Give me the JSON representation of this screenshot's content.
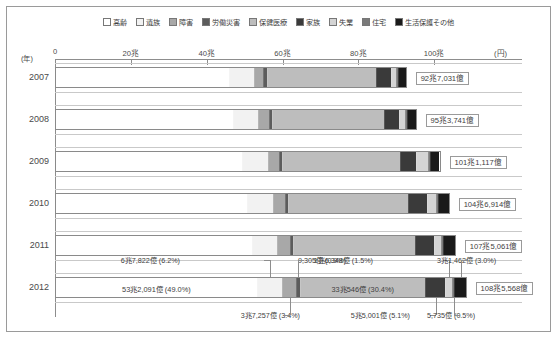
{
  "legend": {
    "items": [
      {
        "label": "高齢",
        "color": "#ffffff"
      },
      {
        "label": "遺族",
        "color": "#f2f2f2"
      },
      {
        "label": "障害",
        "color": "#a8a8a8"
      },
      {
        "label": "労働災害",
        "color": "#5c5c5c"
      },
      {
        "label": "保健医療",
        "color": "#bdbdbd"
      },
      {
        "label": "家族",
        "color": "#3a3a3a"
      },
      {
        "label": "失業",
        "color": "#d4d4d4"
      },
      {
        "label": "住宅",
        "color": "#7a7a7a"
      },
      {
        "label": "生活保護その他",
        "color": "#1a1a1a"
      }
    ]
  },
  "axis": {
    "year_unit": "(年)",
    "value_unit": "(円)",
    "ticks": [
      "0",
      "20兆",
      "40兆",
      "60兆",
      "80兆",
      "100兆"
    ],
    "tick_values": [
      0,
      20,
      40,
      60,
      80,
      100
    ],
    "max": 120
  },
  "chart_data": {
    "type": "bar",
    "orientation": "horizontal",
    "stacked": true,
    "title": "",
    "xlabel": "(円)",
    "ylabel": "(年)",
    "xlim": [
      0,
      120
    ],
    "grid": false,
    "legend_position": "top",
    "unit_note": "兆 = trillion, 億 = hundred million",
    "categories": [
      "2007",
      "2008",
      "2009",
      "2010",
      "2011",
      "2012"
    ],
    "series": [
      {
        "name": "高齢",
        "values": [
          45.8,
          47.0,
          49.4,
          50.7,
          51.9,
          53.2091
        ]
      },
      {
        "name": "遺族",
        "values": [
          6.6,
          6.6,
          6.7,
          6.7,
          6.7,
          6.7822
        ]
      },
      {
        "name": "障害",
        "values": [
          2.6,
          2.8,
          3.0,
          3.2,
          3.4,
          3.7257
        ]
      },
      {
        "name": "労働災害",
        "values": [
          0.95,
          0.95,
          0.94,
          0.93,
          0.93,
          0.9305
        ]
      },
      {
        "name": "保健医療",
        "values": [
          29.0,
          29.6,
          31.1,
          31.8,
          32.2,
          33.0546
        ]
      },
      {
        "name": "家族",
        "values": [
          4.0,
          4.1,
          4.4,
          5.0,
          5.2,
          5.5001
        ]
      },
      {
        "name": "失業",
        "values": [
          1.3,
          1.6,
          3.1,
          2.4,
          1.8,
          1.6348
        ]
      },
      {
        "name": "住宅",
        "values": [
          0.49,
          0.52,
          0.54,
          0.55,
          0.56,
          0.5735
        ]
      },
      {
        "name": "生活保護その他",
        "values": [
          2.0,
          2.2,
          2.5,
          2.8,
          3.0,
          3.1462
        ]
      }
    ],
    "totals": [
      92.7031,
      95.3741,
      101.1117,
      104.6914,
      107.5061,
      108.5568
    ],
    "total_labels": [
      "92兆7,031億",
      "95兆3,741億",
      "101兆1,117億",
      "104兆6,914億",
      "107兆5,061億",
      "108兆5,568億"
    ]
  },
  "bars": [
    {
      "year": "2007",
      "total_label": "92兆7,031億",
      "segments": [
        {
          "name": "高齢",
          "value": 45.8
        },
        {
          "name": "遺族",
          "value": 6.6
        },
        {
          "name": "障害",
          "value": 2.6
        },
        {
          "name": "労働災害",
          "value": 0.95
        },
        {
          "name": "保健医療",
          "value": 29.0
        },
        {
          "name": "家族",
          "value": 4.0
        },
        {
          "name": "失業",
          "value": 1.3
        },
        {
          "name": "住宅",
          "value": 0.49
        },
        {
          "name": "生活保護その他",
          "value": 2.0
        }
      ]
    },
    {
      "year": "2008",
      "total_label": "95兆3,741億",
      "segments": [
        {
          "name": "高齢",
          "value": 47.0
        },
        {
          "name": "遺族",
          "value": 6.6
        },
        {
          "name": "障害",
          "value": 2.8
        },
        {
          "name": "労働災害",
          "value": 0.95
        },
        {
          "name": "保健医療",
          "value": 29.6
        },
        {
          "name": "家族",
          "value": 4.1
        },
        {
          "name": "失業",
          "value": 1.6
        },
        {
          "name": "住宅",
          "value": 0.52
        },
        {
          "name": "生活保護その他",
          "value": 2.2
        }
      ]
    },
    {
      "year": "2009",
      "total_label": "101兆1,117億",
      "segments": [
        {
          "name": "高齢",
          "value": 49.4
        },
        {
          "name": "遺族",
          "value": 6.7
        },
        {
          "name": "障害",
          "value": 3.0
        },
        {
          "name": "労働災害",
          "value": 0.94
        },
        {
          "name": "保健医療",
          "value": 31.1
        },
        {
          "name": "家族",
          "value": 4.4
        },
        {
          "name": "失業",
          "value": 3.1
        },
        {
          "name": "住宅",
          "value": 0.54
        },
        {
          "name": "生活保護その他",
          "value": 2.5
        }
      ]
    },
    {
      "year": "2010",
      "total_label": "104兆6,914億",
      "segments": [
        {
          "name": "高齢",
          "value": 50.7
        },
        {
          "name": "遺族",
          "value": 6.7
        },
        {
          "name": "障害",
          "value": 3.2
        },
        {
          "name": "労働災害",
          "value": 0.93
        },
        {
          "name": "保健医療",
          "value": 31.8
        },
        {
          "name": "家族",
          "value": 5.0
        },
        {
          "name": "失業",
          "value": 2.4
        },
        {
          "name": "住宅",
          "value": 0.55
        },
        {
          "name": "生活保護その他",
          "value": 2.8
        }
      ]
    },
    {
      "year": "2011",
      "total_label": "107兆5,061億",
      "segments": [
        {
          "name": "高齢",
          "value": 51.9
        },
        {
          "name": "遺族",
          "value": 6.7
        },
        {
          "name": "障害",
          "value": 3.4
        },
        {
          "name": "労働災害",
          "value": 0.93
        },
        {
          "name": "保健医療",
          "value": 32.2
        },
        {
          "name": "家族",
          "value": 5.2
        },
        {
          "name": "失業",
          "value": 1.8
        },
        {
          "name": "住宅",
          "value": 0.56
        },
        {
          "name": "生活保護その他",
          "value": 3.0
        }
      ]
    },
    {
      "year": "2012",
      "total_label": "108兆5,568億",
      "segments": [
        {
          "name": "高齢",
          "value": 53.2091
        },
        {
          "name": "遺族",
          "value": 6.7822
        },
        {
          "name": "障害",
          "value": 3.7257
        },
        {
          "name": "労働災害",
          "value": 0.9305
        },
        {
          "name": "保健医療",
          "value": 33.0546
        },
        {
          "name": "家族",
          "value": 5.5001
        },
        {
          "name": "失業",
          "value": 1.6348
        },
        {
          "name": "住宅",
          "value": 0.5735
        },
        {
          "name": "生活保護その他",
          "value": 3.1462
        }
      ]
    }
  ],
  "annotations_2012": {
    "inline": [
      {
        "label": "53兆2,091億 (49.0%)"
      },
      {
        "label": "33兆546億 (30.4%)"
      }
    ],
    "above": [
      {
        "label": "6兆7,822億 (6.2%)"
      },
      {
        "label": "9,305億 (0.9%)"
      },
      {
        "label": "1兆6,348億 (1.5%)"
      },
      {
        "label": "3兆1,462億 (3.0%)"
      }
    ],
    "below": [
      {
        "label": "3兆7,257億 (3.4%)"
      },
      {
        "label": "5兆5,001億 (5.1%)"
      },
      {
        "label": "5,735億 (0.5%)"
      }
    ]
  }
}
